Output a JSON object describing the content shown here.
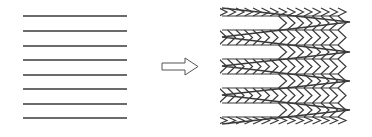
{
  "diagram": {
    "colors": {
      "line": "#3a3a3a",
      "background": "#ffffff",
      "arrow_stroke": "#555555"
    },
    "left_figure": {
      "label": "parallel-lines",
      "x_start": 23,
      "x_end": 127,
      "line_ys": [
        16,
        31,
        46,
        60,
        75,
        89,
        104,
        118
      ]
    },
    "arrow": {
      "direction": "right",
      "shaft_x0": 162,
      "shaft_x1": 185,
      "shaft_y0": 63,
      "shaft_y1": 70,
      "head_x1": 198,
      "head_y0": 58,
      "head_y1": 75
    },
    "right_figure": {
      "label": "zigzag-chevrons",
      "x_left": 222,
      "x_right": 350,
      "envelope_ys": [
        8,
        22,
        37,
        52,
        66,
        81,
        95,
        110,
        124
      ],
      "rule_ys": [
        16,
        30,
        45,
        59,
        74,
        88,
        103,
        117
      ],
      "chevron_spacing": 8.5,
      "chevron_width": 8
    }
  }
}
